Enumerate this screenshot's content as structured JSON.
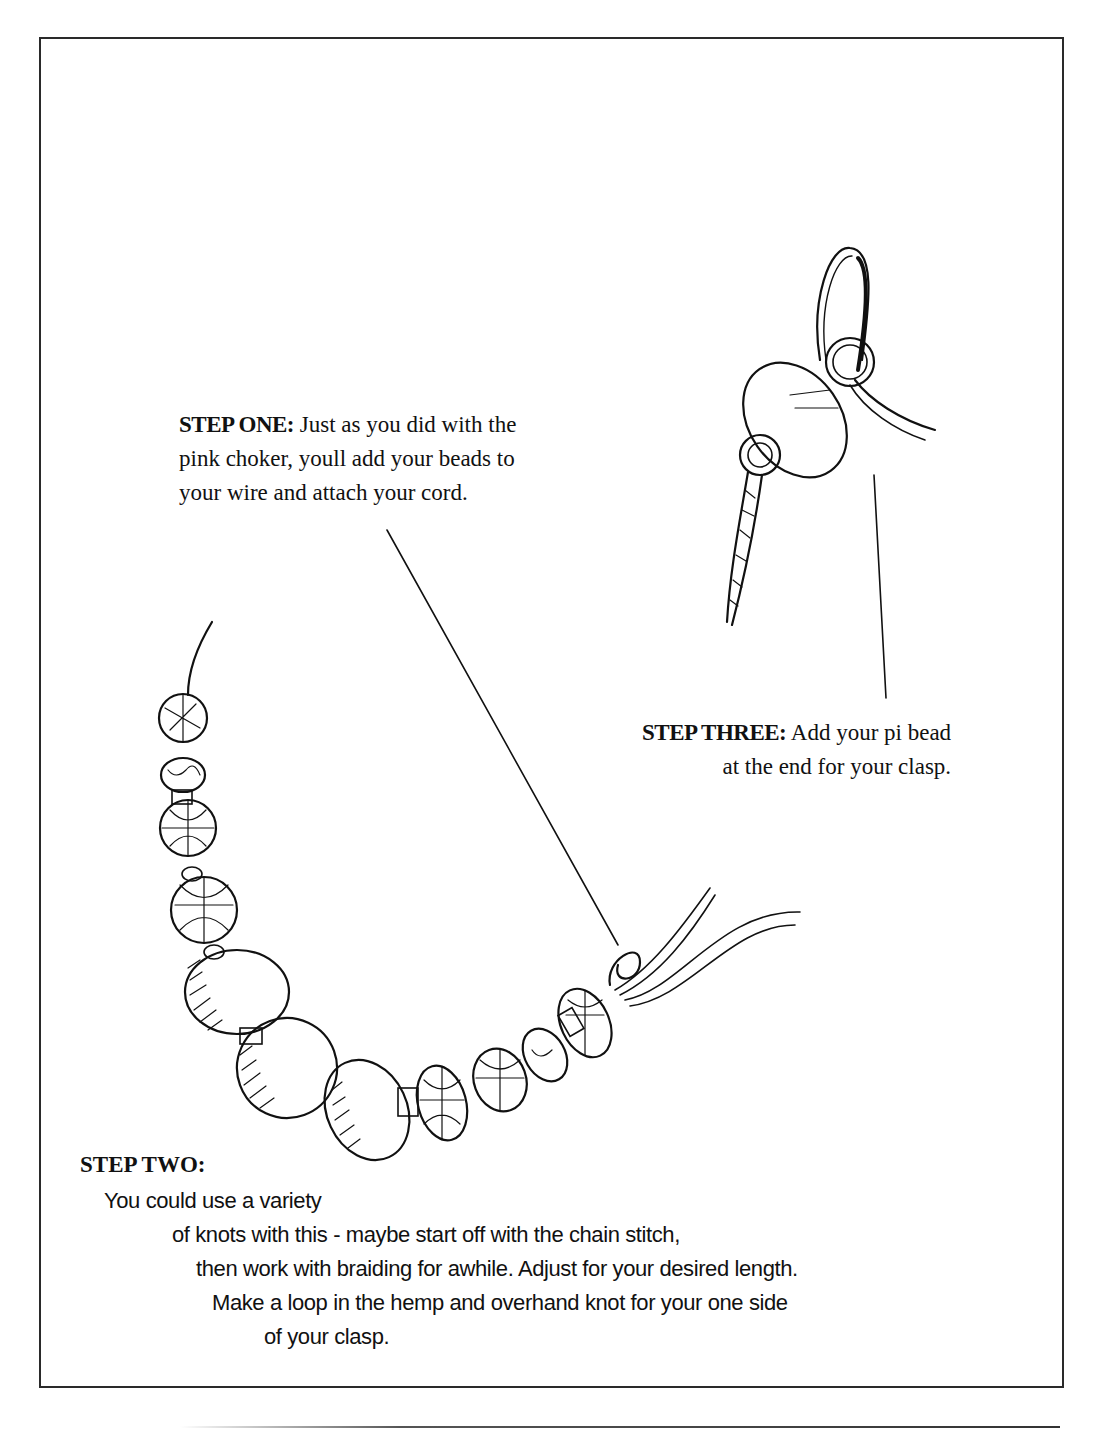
{
  "document": {
    "type": "craft instruction illustration",
    "steps": {
      "step_one": {
        "label": "STEP ONE:",
        "lines": [
          "Just as you did with the",
          "pink choker, youll add your beads to",
          "your wire and attach your cord."
        ]
      },
      "step_two": {
        "label": "STEP TWO:",
        "lines": [
          "You could use a variety",
          "of knots with this - maybe start off with the chain stitch,",
          "then work with braiding for awhile. Adjust for your desired length.",
          "Make a loop in the hemp and overhand knot for your one side",
          "of your clasp."
        ]
      },
      "step_three": {
        "label": "STEP THREE:",
        "lines": [
          "Add your pi bead",
          "at the end for your clasp."
        ]
      }
    },
    "illustrations": [
      {
        "name": "beaded-necklace-drawing",
        "description": "curved strand of hand-drawn beads with a hemp loop at the right end"
      },
      {
        "name": "pi-bead-clasp-drawing",
        "description": "pi bead disc with braided cord and loop"
      }
    ],
    "colors": {
      "ink": "#111111",
      "frame": "#2a2a2a",
      "paper": "#ffffff"
    }
  }
}
